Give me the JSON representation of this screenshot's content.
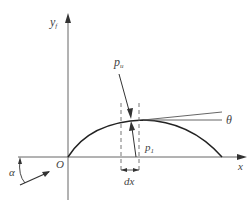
{
  "diagram": {
    "type": "beam-deflection-force-diagram",
    "labels": {
      "y_axis": "y",
      "y_axis_sub": "f",
      "x_axis": "x",
      "origin": "O",
      "pu": "p",
      "pu_sub": "u",
      "p1": "p",
      "p1_sub": "1",
      "theta": "θ",
      "dx": "dx",
      "alpha": "α"
    },
    "colors": {
      "line": "#555555",
      "curve": "#222222",
      "text": "#444444",
      "background": "#ffffff"
    }
  }
}
